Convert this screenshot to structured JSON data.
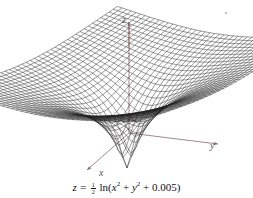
{
  "chart_data": {
    "type": "surface3d",
    "title": "",
    "function": "z = (1/2) ln(x^2 + y^2 + 0.005)",
    "caption": "z = ½ ln(x² + y² + 0.005)",
    "axes": {
      "x": {
        "label": "x"
      },
      "y": {
        "label": "y"
      },
      "z": {
        "label": "z"
      }
    },
    "grid": "wireframe mesh",
    "min_z_at_origin": -2.649,
    "colors": {
      "mesh": "#222222",
      "axes": "#8a6a6a",
      "background": "#ffffff"
    }
  },
  "labels": {
    "x_axis": "x",
    "y_axis": "y",
    "z_axis": "z",
    "caption_prefix": "z = ",
    "caption_num": "1",
    "caption_den": "2",
    "caption_ln": " ln(",
    "caption_x": "x",
    "caption_sq1": "2",
    "caption_plus1": " + ",
    "caption_y": "y",
    "caption_sq2": "2",
    "caption_tail": " + 0.005)"
  }
}
